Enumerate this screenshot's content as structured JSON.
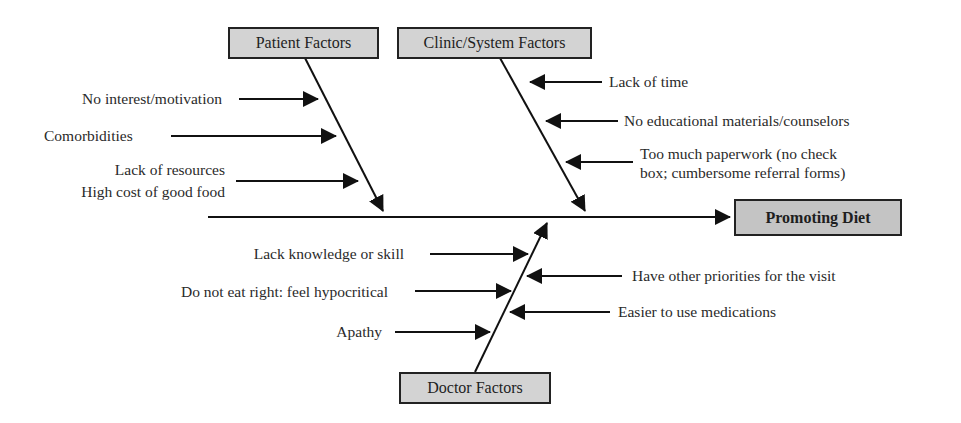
{
  "diagram": {
    "type": "fishbone",
    "effect": {
      "label": "Promoting Diet"
    },
    "categories": [
      {
        "name": "Patient Factors",
        "causes": [
          "No interest/motivation",
          "Comorbidities",
          "Lack of resources",
          "High cost of good food"
        ]
      },
      {
        "name": "Clinic/System Factors",
        "causes": [
          "Lack of time",
          "No educational materials/counselors",
          "Too much paperwork (no check",
          "box; cumbersome referral forms)"
        ]
      },
      {
        "name": "Doctor Factors",
        "causes": [
          "Lack knowledge or skill",
          "Do not eat right: feel hypocritical",
          "Apathy",
          "Have other priorities for the visit",
          "Easier to use medications"
        ]
      }
    ],
    "colors": {
      "box_fill": "#d3d3d3",
      "effect_fill": "#c4c4c4",
      "line": "#111111"
    }
  }
}
